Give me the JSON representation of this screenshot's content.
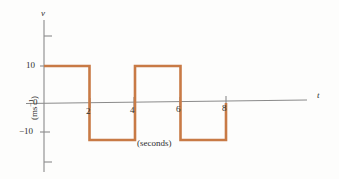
{
  "figure": {
    "background_color": "#fdfdfc",
    "line_color": "#c87a45",
    "axis_color": "#8a8a8a"
  },
  "axes": {
    "y_axis_name": "v",
    "y_unit_label_open": "(ms",
    "y_unit_label_exp": "−1",
    "y_unit_label_close": ")",
    "x_axis_name": "t",
    "x_unit_label": "(seconds)"
  },
  "ticks": {
    "y_labels": [
      "10",
      "0",
      "−10"
    ],
    "x_labels": [
      "2",
      "4",
      "6",
      "8"
    ]
  },
  "chart_data": {
    "type": "line",
    "title": "",
    "subtitle": "",
    "xlabel": "t (seconds)",
    "ylabel": "v (ms⁻¹)",
    "xlim": [
      0,
      12
    ],
    "ylim": [
      -20,
      20
    ],
    "xticks": [
      2,
      4,
      6,
      8
    ],
    "yticks": [
      -20,
      -10,
      0,
      10,
      20
    ],
    "ytick_labels": [
      "",
      "−10",
      "0",
      "10",
      ""
    ],
    "grid": false,
    "legend": null,
    "waveform": "square",
    "amplitude": 10,
    "period": 4,
    "series": [
      {
        "name": "velocity",
        "color": "#c87a45",
        "x": [
          0,
          2,
          2,
          4,
          4,
          6,
          6,
          8,
          8
        ],
        "values": [
          10,
          10,
          -10,
          -10,
          10,
          10,
          -10,
          -10,
          0
        ]
      }
    ],
    "annotations": [
      {
        "text": "(seconds)",
        "x": 5,
        "y": -14
      },
      {
        "text": "v",
        "x": 0,
        "y": 21
      },
      {
        "text": "t",
        "x": 12.3,
        "y": 0
      }
    ]
  }
}
